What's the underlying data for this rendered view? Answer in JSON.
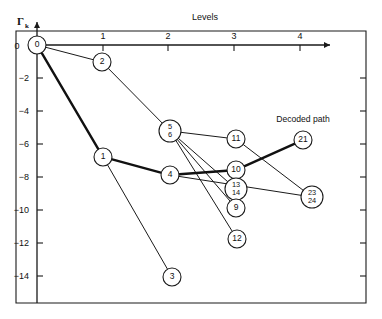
{
  "figure": {
    "name": "decoding-tree-metric-plot",
    "background_color": "#ffffff",
    "line_color": "#1a1a1a"
  },
  "axes": {
    "x_title": "Levels",
    "y_title_main": "Γ",
    "y_title_sub": "k",
    "x_ticks": [
      {
        "label": "0",
        "value": 0,
        "px": 37
      },
      {
        "label": "1",
        "value": 1,
        "px": 103
      },
      {
        "label": "2",
        "value": 2,
        "px": 168
      },
      {
        "label": "3",
        "value": 3,
        "px": 234
      },
      {
        "label": "4",
        "value": 4,
        "px": 300
      }
    ],
    "y_ticks": [
      {
        "label": "0",
        "value": 0,
        "px": 45
      },
      {
        "label": "−2",
        "value": -2,
        "px": 78
      },
      {
        "label": "−4",
        "value": -4,
        "px": 111
      },
      {
        "label": "−6",
        "value": -6,
        "px": 144
      },
      {
        "label": "−8",
        "value": -8,
        "px": 177
      },
      {
        "label": "−10",
        "value": -10,
        "px": 210
      },
      {
        "label": "−12",
        "value": -12,
        "px": 243
      },
      {
        "label": "−14",
        "value": -14,
        "px": 276
      }
    ],
    "x_range": [
      0,
      4.5
    ],
    "y_range": [
      -15.5,
      0.8
    ],
    "x_arrow": true,
    "y_arrow": true,
    "grid": false
  },
  "annotations": [
    {
      "name": "decoded-path-label",
      "text": "Decoded path",
      "x": 303,
      "y": 122
    }
  ],
  "chart_data": {
    "type": "scatter",
    "title": "",
    "subtitle": "",
    "xlabel": "Levels",
    "ylabel": "Γk",
    "xlim": [
      0,
      4.5
    ],
    "ylim": [
      -15.5,
      0.8
    ],
    "grid": false,
    "legend": null,
    "nodes": [
      {
        "id": "n0",
        "labels": [
          "0"
        ],
        "level": 0,
        "metric": 0.0,
        "px": 37,
        "py": 45,
        "r": 9
      },
      {
        "id": "n2",
        "labels": [
          "2"
        ],
        "level": 1,
        "metric": -1.1,
        "px": 102,
        "py": 62,
        "r": 9
      },
      {
        "id": "n1",
        "labels": [
          "1"
        ],
        "level": 1,
        "metric": -6.8,
        "px": 103,
        "py": 157,
        "r": 9
      },
      {
        "id": "n3",
        "labels": [
          "3"
        ],
        "level": 2,
        "metric": -14.0,
        "px": 172,
        "py": 277,
        "r": 9
      },
      {
        "id": "n56",
        "labels": [
          "5",
          "6"
        ],
        "level": 2,
        "metric": -4.9,
        "px": 170,
        "py": 131,
        "r": 11
      },
      {
        "id": "n4",
        "labels": [
          "4"
        ],
        "level": 2,
        "metric": -7.8,
        "px": 170,
        "py": 175,
        "r": 9
      },
      {
        "id": "n11",
        "labels": [
          "11"
        ],
        "level": 3,
        "metric": -5.7,
        "px": 236,
        "py": 139,
        "r": 9
      },
      {
        "id": "n10",
        "labels": [
          "10"
        ],
        "level": 3,
        "metric": -7.4,
        "px": 236,
        "py": 170,
        "r": 9
      },
      {
        "id": "n1314",
        "labels": [
          "13",
          "14"
        ],
        "level": 3,
        "metric": -8.5,
        "px": 236,
        "py": 189,
        "r": 11
      },
      {
        "id": "n9",
        "labels": [
          "9"
        ],
        "level": 3,
        "metric": -9.6,
        "px": 236,
        "py": 208,
        "r": 9
      },
      {
        "id": "n12",
        "labels": [
          "12"
        ],
        "level": 3,
        "metric": -12.0,
        "px": 237,
        "py": 239,
        "r": 9
      },
      {
        "id": "n21",
        "labels": [
          "21"
        ],
        "level": 4,
        "metric": -5.8,
        "px": 303,
        "py": 140,
        "r": 9
      },
      {
        "id": "n2324",
        "labels": [
          "23",
          "24"
        ],
        "level": 4,
        "metric": -10.0,
        "px": 312,
        "py": 197,
        "r": 11
      }
    ],
    "edges": [
      {
        "from": "n0",
        "to": "n2",
        "style": "thin",
        "on_decoded_path": false
      },
      {
        "from": "n0",
        "to": "n1",
        "style": "thick",
        "on_decoded_path": true
      },
      {
        "from": "n2",
        "to": "n56",
        "style": "thin",
        "on_decoded_path": false
      },
      {
        "from": "n1",
        "to": "n4",
        "style": "thick",
        "on_decoded_path": true
      },
      {
        "from": "n1",
        "to": "n3",
        "style": "thin",
        "on_decoded_path": false
      },
      {
        "from": "n56",
        "to": "n11",
        "style": "thin",
        "on_decoded_path": false
      },
      {
        "from": "n56",
        "to": "n1314",
        "style": "thin",
        "on_decoded_path": false
      },
      {
        "from": "n56",
        "to": "n9",
        "style": "thin",
        "on_decoded_path": false
      },
      {
        "from": "n56",
        "to": "n12",
        "style": "thin",
        "on_decoded_path": false
      },
      {
        "from": "n4",
        "to": "n10",
        "style": "thick",
        "on_decoded_path": true
      },
      {
        "from": "n4",
        "to": "n2324",
        "style": "thin",
        "on_decoded_path": false
      },
      {
        "from": "n11",
        "to": "n2324",
        "style": "thin",
        "on_decoded_path": false
      },
      {
        "from": "n10",
        "to": "n21",
        "style": "thick",
        "on_decoded_path": true
      }
    ],
    "decoded_path": [
      "n0",
      "n1",
      "n4",
      "n10",
      "n21"
    ]
  }
}
